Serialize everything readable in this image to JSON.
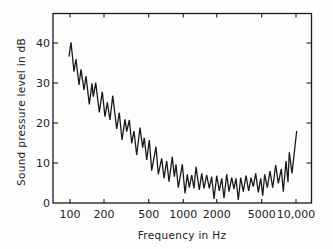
{
  "chart_data": {
    "type": "line",
    "title": "",
    "xlabel": "Frequency in Hz",
    "ylabel": "Sound pressure level in dB",
    "xscale": "log",
    "xlim": [
      90,
      11000
    ],
    "ylim": [
      0,
      47
    ],
    "grid": false,
    "legend": null,
    "x_ticks": [
      {
        "value": 100,
        "label": "100",
        "px": 70
      },
      {
        "value": 200,
        "label": "200",
        "px": 104
      },
      {
        "value": 500,
        "label": "500",
        "px": 148.7
      },
      {
        "value": 1000,
        "label": "1000",
        "px": 183.3
      },
      {
        "value": 2000,
        "label": "2000",
        "px": 216.7
      },
      {
        "value": 5000,
        "label": "5000",
        "px": 261.7
      },
      {
        "value": 10000,
        "label": "10,000",
        "px": 296
      }
    ],
    "y_ticks": [
      {
        "value": 0,
        "label": "0",
        "px": 203
      },
      {
        "value": 10,
        "label": "10",
        "px": 163
      },
      {
        "value": 20,
        "label": "20",
        "px": 123
      },
      {
        "value": 30,
        "label": "30",
        "px": 83
      },
      {
        "value": 40,
        "label": "40",
        "px": 43
      }
    ],
    "series": [
      {
        "name": "Sound pressure level",
        "x": [
          98,
          102,
          108.5,
          113,
          120,
          125,
          133,
          139,
          148,
          157,
          161,
          169,
          182,
          193,
          204,
          214,
          226,
          239,
          259,
          273,
          288,
          307,
          318,
          335,
          352,
          368,
          389,
          416,
          440,
          454,
          477,
          502,
          528,
          577,
          605,
          648,
          679,
          717,
          751,
          803,
          837,
          866,
          907,
          985,
          1041,
          1091,
          1137,
          1194,
          1253,
          1306,
          1396,
          1466,
          1536,
          1622,
          1710,
          1796,
          1880,
          1985,
          2091,
          2196,
          2301,
          2431,
          2546,
          2689,
          2816,
          2932,
          3070,
          3223,
          3399,
          3587,
          3787,
          3967,
          4156,
          4360,
          4600,
          4829,
          5030,
          5236,
          5521,
          5830,
          6157,
          6550,
          6905,
          7341,
          7651,
          8132,
          8463,
          8688,
          9173,
          10100
        ],
        "y": [
          36.6,
          40.2,
          32.8,
          36.0,
          29.5,
          33.4,
          28.3,
          31.8,
          24.7,
          29.9,
          26.6,
          30.1,
          22.7,
          27.8,
          21.6,
          25.2,
          20.8,
          26.8,
          18.5,
          22.6,
          15.8,
          20.9,
          17.8,
          20.8,
          14.9,
          18.0,
          12.0,
          18.8,
          13.8,
          16.3,
          10.8,
          15.8,
          8.1,
          14.1,
          7.2,
          11.2,
          6.2,
          10.5,
          5.3,
          11.6,
          6.6,
          9.7,
          3.8,
          9.7,
          2.4,
          7.2,
          3.8,
          7.0,
          3.7,
          9.1,
          3.3,
          7.4,
          3.7,
          7.0,
          3.7,
          6.6,
          1.0,
          6.8,
          3.0,
          6.2,
          1.2,
          7.2,
          2.8,
          6.3,
          3.5,
          6.2,
          0.8,
          6.3,
          2.8,
          6.8,
          3.0,
          6.3,
          4.1,
          7.4,
          2.7,
          6.2,
          1.8,
          7.2,
          3.8,
          8.0,
          3.8,
          9.5,
          4.9,
          8.5,
          2.8,
          10.5,
          5.2,
          12.7,
          7.4,
          18.0
        ]
      }
    ]
  },
  "plot": {
    "frame": {
      "left": 53,
      "top": 13.5,
      "right": 311.5,
      "bottom": 203
    },
    "polyline_px": "69,56.7 71,42.3 74,71.7 76,59 79,85 81,69.3 84,90 86,76 89.3,104.3 92,83.3 93.3,96.7 95.7,82.7 99.3,112.3 102.3,91.7 105,116.7 107.3,102.3 110,120 112.7,95.7 116.7,129 119.3,112.7 122,140 125,119.3 126.7,131.7 129.3,120 131.7,143.3 134,131 136.7,155 140,127.7 142.7,147.7 144.3,137.7 146.7,160 149.3,140 151.7,170.7 156,146.7 158.3,174.3 161.7,158.3 164,178.3 166.7,161 169,181.7 172.3,156.7 174.3,176.7 176,164.3 178.3,187.7 182.3,164.3 185,193.3 187.3,174.3 189.3,187.7 191.7,175 194,188.3 196,166.7 199.3,190 201.7,173.3 204,188.3 206.7,175 209.3,188.3 211.7,176.7 214,199 216.7,175.7 219.3,191 221.7,178.3 224,198.3 226.7,174.3 229,191.7 231.7,177.7 234,189 236,178.3 238.3,200 240.7,177.7 243.3,191.7 246,175.7 248.7,191 251,177.7 253.3,186.7 255.7,173.3 258.3,192.3 260.7,178.3 262.7,195.7 264.7,174.3 267.3,187.7 270,171 272.7,187.7 275.7,165 278.3,183.3 281.3,169 283.3,191.7 286,161 288,182.3 289.3,152.3 292,173.3 296.7,131",
    "line_color": "#1a1a1a"
  }
}
